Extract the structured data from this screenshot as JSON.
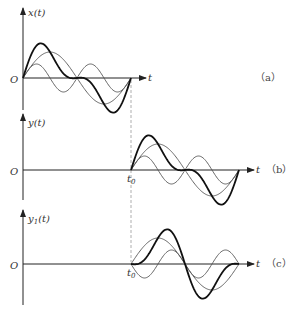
{
  "panels": [
    {
      "id": "a",
      "ylabel": "x(t)",
      "xlabel": "t",
      "origin": "O",
      "tag": "（a）",
      "shift_label": ""
    },
    {
      "id": "b",
      "ylabel": "y(t)",
      "xlabel": "t",
      "origin": "O",
      "tag": "（b）",
      "shift_label": "t0"
    },
    {
      "id": "c",
      "ylabel": "y1(t)",
      "xlabel": "t",
      "origin": "O",
      "tag": "（c）",
      "shift_label": "t0"
    }
  ],
  "labels": {
    "a_y": "x(t)",
    "b_y": "y(t)",
    "c_y_main": "y",
    "c_y_sub": "1",
    "c_y_rest": "(t)",
    "t": "t",
    "O": "O",
    "t0_main": "t",
    "t0_sub": "0",
    "tag_a": "（a）",
    "tag_b": "（b）",
    "tag_c": "（c）"
  },
  "colors": {
    "curve_bold": "#111111",
    "curve_thin": "#555555",
    "axis": "#222222",
    "dashed": "#999999"
  }
}
